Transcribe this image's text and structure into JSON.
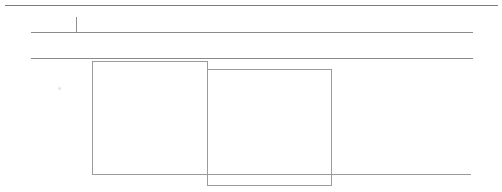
{
  "canvas": {
    "width": 502,
    "height": 192,
    "background_color": "#ffffff",
    "description": "Minimal wireframe skeleton: three horizontal rules, a vertical tick, and two overlapping rectangular panels"
  },
  "colors": {
    "line": "#8a8a8a",
    "line_dark": "#7d7d7d",
    "panel_border": "#9b9b9b",
    "baseline": "#9a9a9a",
    "speck": "#e4e4e4",
    "background": "#ffffff"
  },
  "rules": [
    {
      "name": "top-rule",
      "x": 5,
      "y": 5,
      "width": 493,
      "color": "#7d7d7d"
    },
    {
      "name": "second-rule",
      "x": 31,
      "y": 32,
      "width": 442,
      "color": "#8a8a8a"
    },
    {
      "name": "third-rule",
      "x": 31,
      "y": 58,
      "width": 442,
      "color": "#8a8a8a"
    }
  ],
  "baseline": {
    "name": "panel-baseline",
    "x": 92,
    "y": 174,
    "width": 379,
    "color": "#9a9a9a"
  },
  "tick": {
    "name": "vertical-tick",
    "x": 76,
    "y": 17,
    "height": 16,
    "color": "#8f8f8f"
  },
  "panels": [
    {
      "name": "left-panel",
      "x": 92,
      "y": 61,
      "width": 116,
      "height": 114,
      "border_color": "#9b9b9b",
      "fill": "transparent"
    },
    {
      "name": "middle-panel",
      "x": 207,
      "y": 69,
      "width": 125,
      "height": 117,
      "border_color": "#9b9b9b",
      "fill": "transparent"
    }
  ],
  "speck": {
    "name": "artifact-speck",
    "x": 58,
    "y": 87,
    "size": 3,
    "color": "#e4e4e4"
  }
}
